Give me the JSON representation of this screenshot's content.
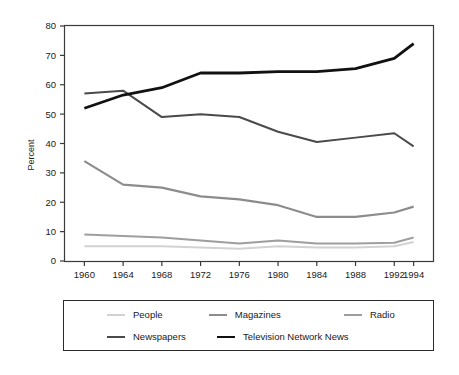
{
  "chart_data": {
    "type": "line",
    "title": "",
    "subtitle": "",
    "xlabel": "",
    "ylabel": "Percent",
    "x": [
      1960,
      1964,
      1968,
      1972,
      1976,
      1980,
      1984,
      1988,
      1992,
      1994
    ],
    "xtick_labels": [
      "1960",
      "1964",
      "1968",
      "1972",
      "1976",
      "1980",
      "1984",
      "1988",
      "1992",
      "1994"
    ],
    "ytick_labels": [
      "0",
      "10",
      "20",
      "30",
      "40",
      "50",
      "60",
      "70",
      "80"
    ],
    "ytick_values": [
      0,
      10,
      20,
      30,
      40,
      50,
      60,
      70,
      80
    ],
    "xlim": [
      1958,
      1996
    ],
    "ylim": [
      0,
      80
    ],
    "grid": false,
    "legend_position": "below",
    "series": [
      {
        "name": "People",
        "color": "#d2d2d2",
        "width": 2.0,
        "values": [
          5.0,
          5.0,
          5.0,
          4.6,
          4.2,
          5.0,
          4.6,
          4.6,
          5.0,
          6.5
        ]
      },
      {
        "name": "Magazines",
        "color": "#8c8c8c",
        "width": 2.2,
        "values": [
          34.0,
          26.0,
          25.0,
          22.0,
          21.0,
          19.0,
          15.0,
          15.0,
          16.5,
          18.5
        ]
      },
      {
        "name": "Radio",
        "color": "#9e9e9e",
        "width": 2.0,
        "values": [
          9.0,
          8.5,
          8.0,
          7.0,
          6.0,
          7.0,
          6.0,
          6.0,
          6.2,
          8.0
        ]
      },
      {
        "name": "Newspapers",
        "color": "#4a4a4a",
        "width": 2.0,
        "values": [
          57.0,
          58.0,
          49.0,
          50.0,
          49.0,
          44.0,
          40.5,
          42.0,
          43.5,
          39.0
        ]
      },
      {
        "name": "Television Network News",
        "color": "#111111",
        "width": 2.8,
        "values": [
          52.0,
          56.5,
          59.0,
          64.0,
          64.0,
          64.5,
          64.5,
          65.5,
          69.0,
          74.0
        ]
      }
    ]
  },
  "legend": {
    "rows": [
      [
        {
          "label": "People",
          "series": 0
        },
        {
          "label": "Magazines",
          "series": 1
        },
        {
          "label": "Radio",
          "series": 2
        }
      ],
      [
        {
          "label": "Newspapers",
          "series": 3
        },
        {
          "label": "Television Network News",
          "series": 4
        }
      ]
    ]
  }
}
